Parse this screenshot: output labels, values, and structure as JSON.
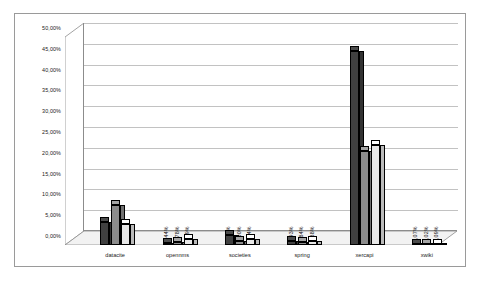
{
  "chart_data": {
    "type": "bar",
    "title": "",
    "subtitle": "",
    "xlabel": "",
    "ylabel": "",
    "ylim": [
      0,
      50
    ],
    "ytick_step": 5,
    "grid": true,
    "legend": "none",
    "orientation": "vertical",
    "grouping": "clustered-3d",
    "decimal_separator": ",",
    "value_suffix": "%",
    "categories": [
      "datacite",
      "opennms",
      "societies",
      "spring",
      "xercapi",
      "xwiki"
    ],
    "ytick_labels": [
      "0,00%",
      "5,00%",
      "10,00%",
      "15,00%",
      "20,00%",
      "25,00%",
      "30,00%",
      "35,00%",
      "40,00%",
      "45,00%",
      "50,00%"
    ],
    "series": [
      {
        "name": "series-1",
        "color": "#404040",
        "values": [
          5.5,
          0.44,
          2.37,
          0.93,
          46.72,
          0.07
        ],
        "labels": [
          "5,50%",
          "0,44%",
          "2,37%",
          "0,93%",
          "46,72%",
          "0,07%"
        ]
      },
      {
        "name": "series-2",
        "color": "#8c8c8c",
        "values": [
          9.5,
          0.78,
          1.0,
          0.84,
          22.63,
          0.02
        ],
        "labels": [
          "9,50%",
          "0,78%",
          "1,00%",
          "0,84%",
          "22,63%",
          "0,02%"
        ]
      },
      {
        "name": "series-3",
        "color": "#e8e8e8",
        "values": [
          5.0,
          1.39,
          1.44,
          0.88,
          24.09,
          0.09
        ],
        "labels": [
          "5,00%",
          "1,39%",
          "1,44%",
          "0,88%",
          "24,09%",
          "0,09%"
        ]
      }
    ]
  }
}
